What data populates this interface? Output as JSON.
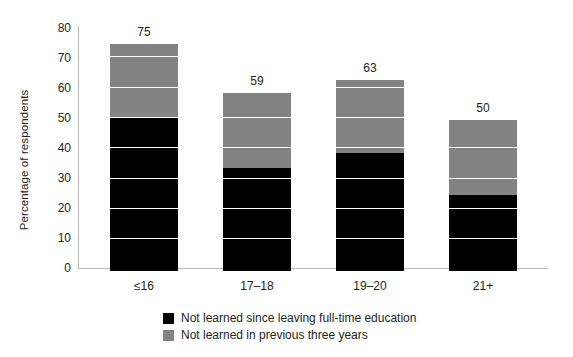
{
  "chart_data": {
    "type": "bar",
    "stacked": true,
    "title": "",
    "xlabel": "",
    "ylabel": "Percentage of respondents",
    "categories": [
      "≤16",
      "17–18",
      "19–20",
      "21+"
    ],
    "totals": [
      75,
      59,
      63,
      50
    ],
    "series": [
      {
        "name": "Not learned since leaving full-time education",
        "color": "#000000",
        "values": [
          51,
          34,
          39,
          25
        ]
      },
      {
        "name": "Not learned in previous three years",
        "color": "#838383",
        "values": [
          24,
          25,
          24,
          25
        ]
      }
    ],
    "ylim": [
      0,
      80
    ],
    "y_ticks": [
      0,
      10,
      20,
      30,
      40,
      50,
      60,
      70,
      80
    ],
    "y_tick_labels": [
      "0",
      "10",
      "20",
      "30",
      "40",
      "50",
      "60",
      "70",
      "80"
    ],
    "grid": "horizontal-white-over-bars",
    "legend_position": "bottom-center",
    "axis_color": "#b9b9b9",
    "text_color": "#231f20",
    "background": "#ffffff"
  },
  "bar_labels": {
    "b0": "75",
    "b1": "59",
    "b2": "63",
    "b3": "50"
  },
  "category_labels": {
    "c0": "≤16",
    "c1": "17–18",
    "c2": "19–20",
    "c3": "21+"
  },
  "y_axis": {
    "title": "Percentage of respondents",
    "t0": "0",
    "t10": "10",
    "t20": "20",
    "t30": "30",
    "t40": "40",
    "t50": "50",
    "t60": "60",
    "t70": "70",
    "t80": "80"
  },
  "legend": {
    "items": [
      {
        "label": "Not learned since leaving full-time education",
        "color": "#000000"
      },
      {
        "label": "Not learned in previous three years",
        "color": "#838383"
      }
    ]
  }
}
